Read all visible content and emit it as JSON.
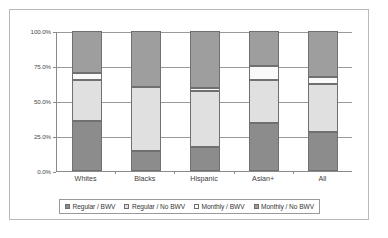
{
  "chart_data": {
    "type": "bar",
    "subtype": "stacked-percent",
    "title": "",
    "xlabel": "",
    "ylabel": "",
    "ylim": [
      0,
      100
    ],
    "yticks": [
      0,
      25,
      50,
      75,
      100
    ],
    "ytick_labels": [
      "0.0%",
      "25.0%",
      "50.0%",
      "75.0%",
      "100.0%"
    ],
    "grid": true,
    "legend_position": "bottom",
    "categories": [
      "Whites",
      "Blacks",
      "Hispanic",
      "Asian+",
      "All"
    ],
    "series": [
      {
        "name": "Regular / BWV",
        "color": "#8c8c8c",
        "values": [
          36.0,
          14.0,
          17.0,
          34.0,
          28.0
        ]
      },
      {
        "name": "Regular / No BWV",
        "color": "#e0e0e0",
        "values": [
          29.0,
          46.0,
          40.0,
          31.0,
          34.0
        ]
      },
      {
        "name": "Monthly / BWV",
        "color": "#fafafa",
        "values": [
          5.0,
          0.0,
          2.0,
          10.0,
          5.0
        ]
      },
      {
        "name": "Monthly / No BWV",
        "color": "#9e9e9e",
        "values": [
          30.0,
          40.0,
          41.0,
          25.0,
          33.0
        ]
      }
    ]
  },
  "legend": {
    "items": [
      {
        "label": "Regular / BWV"
      },
      {
        "label": "Regular / No BWV"
      },
      {
        "label": "Monthly / BWV"
      },
      {
        "label": "Monthly / No BWV"
      }
    ]
  },
  "colors": {
    "frame_border": "#b9b9b9",
    "axis": "#8a8a8a",
    "gridline": "#9a9a9a",
    "background": "#ffffff",
    "segment_border": "#707070"
  }
}
